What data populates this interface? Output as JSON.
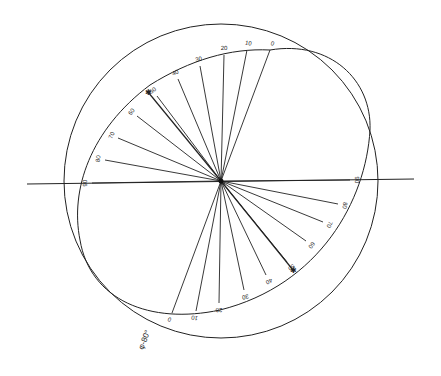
{
  "diagram": {
    "type": "polar-projection",
    "center": [
      221,
      181
    ],
    "circle": {
      "cx": 221,
      "cy": 181,
      "r": 157
    },
    "axis_line": {
      "x1": 27,
      "y1": 184,
      "x2": 414,
      "y2": 179
    },
    "ellipse_label": "φ-80°",
    "upper_rays": [
      {
        "label": "0",
        "x": 270,
        "y": 50
      },
      {
        "label": "10",
        "x": 247,
        "y": 50
      },
      {
        "label": "20",
        "x": 224,
        "y": 55
      },
      {
        "label": "30",
        "x": 200,
        "y": 66
      },
      {
        "label": "40",
        "x": 178,
        "y": 79
      },
      {
        "label": "50",
        "x": 157,
        "y": 96
      },
      {
        "label": "60",
        "x": 137,
        "y": 116
      },
      {
        "label": "70",
        "x": 118,
        "y": 138
      },
      {
        "label": "80",
        "x": 105,
        "y": 160
      },
      {
        "label": "90",
        "x": 92,
        "y": 183
      }
    ],
    "lower_rays": [
      {
        "label": "90",
        "x": 350,
        "y": 180
      },
      {
        "label": "80",
        "x": 338,
        "y": 204
      },
      {
        "label": "70",
        "x": 323,
        "y": 222
      },
      {
        "label": "60",
        "x": 306,
        "y": 241
      },
      {
        "label": "50",
        "x": 287,
        "y": 262
      },
      {
        "label": "40",
        "x": 266,
        "y": 275
      },
      {
        "label": "30",
        "x": 244,
        "y": 290
      },
      {
        "label": "20",
        "x": 219,
        "y": 303
      },
      {
        "label": "10",
        "x": 196,
        "y": 311
      },
      {
        "label": "0",
        "x": 172,
        "y": 313
      }
    ],
    "markers": [
      {
        "symbol": "✱",
        "x": 148,
        "y": 92
      },
      {
        "symbol": "✱",
        "x": 293,
        "y": 270
      }
    ],
    "stroke_color": "#222222"
  }
}
